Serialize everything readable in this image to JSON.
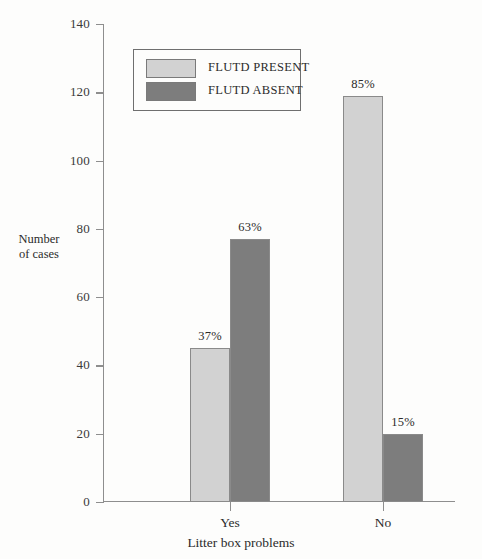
{
  "chart_data": {
    "type": "bar",
    "title": "",
    "xlabel": "Litter box problems",
    "ylabel": "Number\nof cases",
    "ylabel_line1": "Number",
    "ylabel_line2": "of cases",
    "categories": [
      "Yes",
      "No"
    ],
    "ylim": [
      0,
      140
    ],
    "yticks": [
      0,
      20,
      40,
      60,
      80,
      100,
      120,
      140
    ],
    "ytick_labels": [
      "0",
      "20",
      "40",
      "60",
      "80",
      "100",
      "120",
      "140"
    ],
    "grid": false,
    "legend_position": "upper-center",
    "series": [
      {
        "name": "FLUTD PRESENT",
        "color": "#d2d2d2",
        "values": [
          45,
          119
        ],
        "data_labels": [
          "37%",
          "85%"
        ]
      },
      {
        "name": "FLUTD ABSENT",
        "color": "#7d7d7d",
        "values": [
          77,
          20
        ],
        "data_labels": [
          "63%",
          "15%"
        ]
      }
    ]
  },
  "legend": {
    "items": [
      {
        "label": "FLUTD PRESENT",
        "swatch": "present"
      },
      {
        "label": "FLUTD ABSENT",
        "swatch": "absent"
      }
    ]
  },
  "colors": {
    "present": "#d2d2d2",
    "absent": "#7d7d7d",
    "axis": "#8e8e8e",
    "text": "#2b2b2b",
    "background": "#fdfdfc"
  }
}
